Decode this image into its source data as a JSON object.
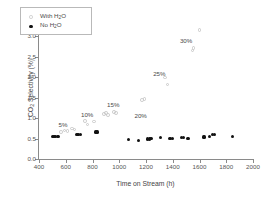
{
  "chart_data": {
    "type": "scatter",
    "title": "",
    "xlabel": "Time on Stream (h)",
    "ylabel": "CO2 Selectivity (%)",
    "ylabel_parts": {
      "pre": "CO",
      "sub": "2",
      "post": " Selectivity (%)"
    },
    "xlim": [
      400,
      2000
    ],
    "ylim": [
      0.0,
      3.5
    ],
    "xticks": [
      400,
      600,
      800,
      1000,
      1200,
      1400,
      1600,
      1800,
      2000
    ],
    "yticks": [
      "0.0",
      "0.5",
      "1.0",
      "1.5",
      "2.0",
      "2.5",
      "3.0",
      "3.5"
    ],
    "grid": false,
    "legend_position": "upper-left-inside",
    "colors": {
      "with_water": "#c9c9c9",
      "no_water": "#111111",
      "axis": "#8a8a8a",
      "text": "#4a4a4a"
    },
    "series": [
      {
        "name": "With H2O",
        "name_parts": {
          "pre": "With H",
          "sub": "2",
          "post": "O"
        },
        "marker": "open-circle",
        "color": "#c9c9c9",
        "points": [
          [
            566,
            0.66
          ],
          [
            590,
            0.7
          ],
          [
            612,
            0.69
          ],
          [
            648,
            0.75
          ],
          [
            666,
            0.72
          ],
          [
            742,
            0.93
          ],
          [
            764,
            0.84
          ],
          [
            812,
            0.92
          ],
          [
            886,
            1.1
          ],
          [
            900,
            1.13
          ],
          [
            918,
            1.08
          ],
          [
            962,
            1.15
          ],
          [
            975,
            1.12
          ],
          [
            1172,
            1.45
          ],
          [
            1188,
            1.47
          ],
          [
            1340,
            1.99
          ],
          [
            1362,
            1.82
          ],
          [
            1548,
            2.66
          ],
          [
            1556,
            2.71
          ],
          [
            1600,
            3.16
          ]
        ]
      },
      {
        "name": "No H2O",
        "name_parts": {
          "pre": "No H",
          "sub": "2",
          "post": "O"
        },
        "marker": "filled-circle",
        "color": "#111111",
        "points": [
          [
            500,
            0.55
          ],
          [
            512,
            0.55
          ],
          [
            524,
            0.56
          ],
          [
            536,
            0.55
          ],
          [
            548,
            0.56
          ],
          [
            684,
            0.59
          ],
          [
            698,
            0.59
          ],
          [
            710,
            0.6
          ],
          [
            826,
            0.66
          ],
          [
            840,
            0.66
          ],
          [
            1072,
            0.48
          ],
          [
            1146,
            0.46
          ],
          [
            1212,
            0.49
          ],
          [
            1226,
            0.49
          ],
          [
            1238,
            0.5
          ],
          [
            1308,
            0.53
          ],
          [
            1380,
            0.51
          ],
          [
            1396,
            0.51
          ],
          [
            1468,
            0.52
          ],
          [
            1482,
            0.52
          ],
          [
            1508,
            0.51
          ],
          [
            1520,
            0.5
          ],
          [
            1628,
            0.54
          ],
          [
            1640,
            0.54
          ],
          [
            1676,
            0.56
          ],
          [
            1700,
            0.59
          ],
          [
            1712,
            0.6
          ],
          [
            1844,
            0.55
          ]
        ]
      }
    ],
    "annotations": [
      {
        "text": "5%",
        "x": 580,
        "y": 0.83
      },
      {
        "text": "10%",
        "x": 760,
        "y": 1.07
      },
      {
        "text": "15%",
        "x": 955,
        "y": 1.33
      },
      {
        "text": "20%",
        "x": 1160,
        "y": 1.05
      },
      {
        "text": "25%",
        "x": 1300,
        "y": 2.07
      },
      {
        "text": "30%",
        "x": 1500,
        "y": 2.88
      }
    ]
  }
}
